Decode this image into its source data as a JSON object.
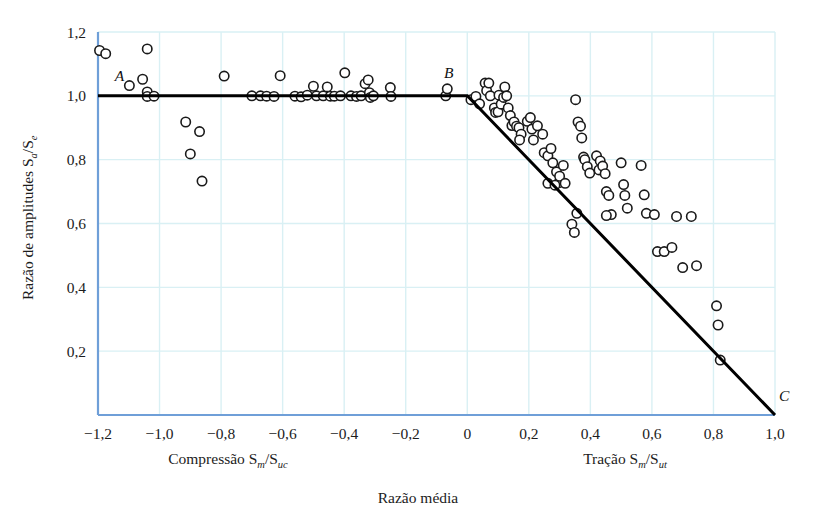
{
  "figure": {
    "title": "",
    "axis_color": "#6f9fd8",
    "grid_color": "#d9f0f4",
    "curve_color": "#000000",
    "marker_edge_color": "#1a1a1a",
    "marker_fill_color": "#ffffff",
    "background": "#ffffff"
  },
  "labels": {
    "y_axis": "Razão de amplitudes S",
    "y_axis_sub1": "a",
    "y_axis_mid": "/S",
    "y_axis_sub2": "e",
    "x_axis_left": "Compressão S",
    "x_axis_left_sub1": "m",
    "x_axis_left_mid": "/S",
    "x_axis_left_sub2": "uc",
    "x_axis_right": "Tração S",
    "x_axis_right_sub1": "m",
    "x_axis_right_mid": "/S",
    "x_axis_right_sub2": "ut",
    "x_axis_main": "Razão média",
    "point_a": "A",
    "point_b": "B",
    "point_c": "C"
  },
  "chart_data": {
    "type": "scatter",
    "title": "",
    "xlabel": "Razão média",
    "ylabel": "Razão de amplitudes Sa/Se",
    "xlim": [
      -1.2,
      1.0
    ],
    "ylim": [
      0.0,
      1.2
    ],
    "xticks": [
      -1.2,
      -1.0,
      -0.8,
      -0.6,
      -0.4,
      -0.2,
      0,
      0.2,
      0.4,
      0.6,
      0.8,
      1.0
    ],
    "xticklabels": [
      "−1,2",
      "−1,0",
      "−0,8",
      "−0,6",
      "−0,4",
      "−0,2",
      "0",
      "0,2",
      "0,4",
      "0,6",
      "0,8",
      "1,0"
    ],
    "yticks": [
      0.2,
      0.4,
      0.6,
      0.8,
      1.0,
      1.2
    ],
    "yticklabels": [
      "0,2",
      "0,4",
      "0,6",
      "0,8",
      "1,0",
      "1,2"
    ],
    "grid": true,
    "legend": "none",
    "annotations": [
      {
        "text": "A",
        "x": -1.13,
        "y": 1.045
      },
      {
        "text": "B",
        "x": -0.06,
        "y": 1.055
      },
      {
        "text": "C",
        "x": 1.03,
        "y": 0.045
      }
    ],
    "series": [
      {
        "name": "Goodman modificado (envelope A-B-C)",
        "type": "line",
        "color": "#000000",
        "width": 3,
        "x": [
          -1.2,
          0.0,
          1.0
        ],
        "y": [
          1.0,
          1.0,
          0.0
        ]
      },
      {
        "name": "Dados experimentais",
        "type": "scatter",
        "marker": "o",
        "points": [
          [
            -1.195,
            1.142
          ],
          [
            -1.175,
            1.132
          ],
          [
            -1.04,
            1.147
          ],
          [
            -1.098,
            1.032
          ],
          [
            -1.055,
            1.052
          ],
          [
            -1.04,
            1.012
          ],
          [
            -1.04,
            0.998
          ],
          [
            -1.018,
            0.999
          ],
          [
            -0.915,
            0.918
          ],
          [
            -0.9,
            0.818
          ],
          [
            -0.87,
            0.888
          ],
          [
            -0.862,
            0.733
          ],
          [
            -0.79,
            1.062
          ],
          [
            -0.7,
            1.0
          ],
          [
            -0.672,
            1.0
          ],
          [
            -0.652,
            0.999
          ],
          [
            -0.628,
            0.998
          ],
          [
            -0.608,
            1.063
          ],
          [
            -0.56,
            0.999
          ],
          [
            -0.54,
            0.997
          ],
          [
            -0.52,
            1.002
          ],
          [
            -0.5,
            1.03
          ],
          [
            -0.49,
            1.0
          ],
          [
            -0.468,
            1.0
          ],
          [
            -0.455,
            1.028
          ],
          [
            -0.445,
            0.999
          ],
          [
            -0.432,
            0.999
          ],
          [
            -0.412,
            1.0
          ],
          [
            -0.398,
            1.072
          ],
          [
            -0.378,
            1.0
          ],
          [
            -0.36,
            0.998
          ],
          [
            -0.345,
            1.0
          ],
          [
            -0.332,
            1.038
          ],
          [
            -0.322,
            1.05
          ],
          [
            -0.318,
            1.01
          ],
          [
            -0.315,
            0.995
          ],
          [
            -0.305,
            1.0
          ],
          [
            -0.25,
            1.026
          ],
          [
            -0.248,
            0.998
          ],
          [
            -0.07,
            1.0
          ],
          [
            -0.065,
            1.022
          ],
          [
            0.012,
            0.988
          ],
          [
            0.028,
            0.998
          ],
          [
            0.04,
            0.975
          ],
          [
            0.058,
            1.04
          ],
          [
            0.063,
            1.016
          ],
          [
            0.07,
            1.04
          ],
          [
            0.075,
            1.0
          ],
          [
            0.088,
            0.962
          ],
          [
            0.092,
            0.948
          ],
          [
            0.1,
            0.95
          ],
          [
            0.103,
            1.002
          ],
          [
            0.11,
            0.974
          ],
          [
            0.118,
            0.995
          ],
          [
            0.122,
            1.028
          ],
          [
            0.128,
            1.0
          ],
          [
            0.133,
            0.962
          ],
          [
            0.14,
            0.938
          ],
          [
            0.145,
            0.907
          ],
          [
            0.152,
            0.918
          ],
          [
            0.16,
            0.905
          ],
          [
            0.168,
            0.9
          ],
          [
            0.175,
            0.88
          ],
          [
            0.17,
            0.862
          ],
          [
            0.195,
            0.92
          ],
          [
            0.205,
            0.932
          ],
          [
            0.21,
            0.896
          ],
          [
            0.215,
            0.862
          ],
          [
            0.228,
            0.906
          ],
          [
            0.245,
            0.88
          ],
          [
            0.25,
            0.822
          ],
          [
            0.262,
            0.812
          ],
          [
            0.272,
            0.835
          ],
          [
            0.278,
            0.79
          ],
          [
            0.29,
            0.762
          ],
          [
            0.298,
            0.728
          ],
          [
            0.3,
            0.748
          ],
          [
            0.312,
            0.782
          ],
          [
            0.318,
            0.726
          ],
          [
            0.262,
            0.726
          ],
          [
            0.285,
            0.72
          ],
          [
            0.352,
            0.988
          ],
          [
            0.36,
            0.918
          ],
          [
            0.368,
            0.905
          ],
          [
            0.372,
            0.868
          ],
          [
            0.378,
            0.808
          ],
          [
            0.382,
            0.8
          ],
          [
            0.39,
            0.778
          ],
          [
            0.398,
            0.758
          ],
          [
            0.356,
            0.632
          ],
          [
            0.34,
            0.598
          ],
          [
            0.348,
            0.572
          ],
          [
            0.42,
            0.812
          ],
          [
            0.428,
            0.768
          ],
          [
            0.432,
            0.796
          ],
          [
            0.44,
            0.78
          ],
          [
            0.448,
            0.756
          ],
          [
            0.452,
            0.7
          ],
          [
            0.46,
            0.688
          ],
          [
            0.468,
            0.628
          ],
          [
            0.452,
            0.625
          ],
          [
            0.5,
            0.79
          ],
          [
            0.508,
            0.722
          ],
          [
            0.512,
            0.688
          ],
          [
            0.52,
            0.648
          ],
          [
            0.565,
            0.782
          ],
          [
            0.575,
            0.69
          ],
          [
            0.582,
            0.632
          ],
          [
            0.608,
            0.628
          ],
          [
            0.618,
            0.512
          ],
          [
            0.64,
            0.512
          ],
          [
            0.665,
            0.525
          ],
          [
            0.68,
            0.622
          ],
          [
            0.7,
            0.462
          ],
          [
            0.728,
            0.622
          ],
          [
            0.745,
            0.468
          ],
          [
            0.81,
            0.342
          ],
          [
            0.815,
            0.282
          ],
          [
            0.822,
            0.172
          ]
        ]
      }
    ]
  }
}
